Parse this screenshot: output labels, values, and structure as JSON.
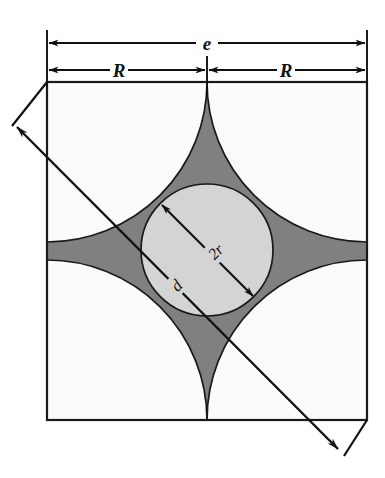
{
  "figure": {
    "background_color": "#ffffff",
    "square": {
      "name": "shaded-unit-cell",
      "fill_color": "#808080",
      "stroke_color": "#1a1a1a",
      "left": 47,
      "top": 82,
      "right": 367,
      "bottom": 420
    },
    "corner_arcs": {
      "name": "corner-quarter-arcs",
      "radius_px": 160,
      "count": 4,
      "fill_color": "#fbfbfb",
      "stroke_color": "#1a1a1a"
    },
    "center_circle": {
      "name": "inscribed-circle",
      "cx": 207,
      "cy": 250,
      "r": 66,
      "fill_color": "#d4d4d4",
      "stroke_color": "#1a1a1a"
    }
  },
  "dimensions": [
    {
      "id": "e",
      "label": "e",
      "kind": "horizontal-double-arrow",
      "description": "overall cell edge length across full square width",
      "y": 43,
      "x_start": 47,
      "x_end": 367
    },
    {
      "id": "R-left",
      "label": "R",
      "kind": "horizontal-double-arrow",
      "description": "corner arc radius, left half of cell",
      "y": 70,
      "x_start": 47,
      "x_end": 207
    },
    {
      "id": "R-right",
      "label": "R",
      "kind": "horizontal-double-arrow",
      "description": "corner arc radius, right half of cell",
      "y": 70,
      "x_start": 207,
      "x_end": 367
    },
    {
      "id": "2r",
      "label": "2r",
      "kind": "diagonal-double-arrow",
      "description": "diameter of the inscribed center circle",
      "x_start": 161,
      "y_start": 204,
      "x_end": 254,
      "y_end": 297
    },
    {
      "id": "d",
      "label": "d",
      "kind": "diagonal-double-arrow",
      "description": "full cell diagonal extending past both corners",
      "x_start": 14,
      "y_start": 124,
      "x_end": 341,
      "y_end": 452
    }
  ],
  "extension_lines": {
    "name": "dimension-extension-lines",
    "color": "#101010",
    "positions_x": [
      47,
      207,
      367
    ],
    "top": 30,
    "bottom": 96
  },
  "leaders": {
    "name": "corner-leader-lines",
    "color": "#101010",
    "top_left": {
      "from_x": 47,
      "from_y": 82,
      "to_x": 14,
      "to_y": 124
    },
    "bottom_right": {
      "from_x": 367,
      "from_y": 420,
      "to_x": 341,
      "to_y": 452
    }
  },
  "colors": {
    "shaded_gray": "#808080",
    "circle_gray": "#d4d4d4",
    "cusp_white": "#fbfbfb",
    "line_black": "#1a1a1a",
    "page_white": "#ffffff"
  }
}
